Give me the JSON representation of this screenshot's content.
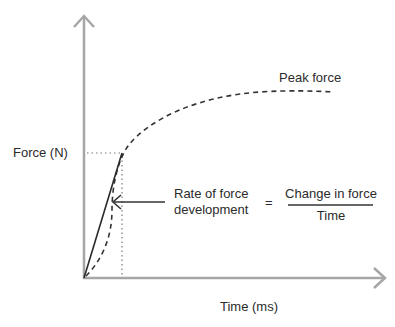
{
  "diagram": {
    "title": "Rate of force development",
    "y_axis_label": "Force (N)",
    "x_axis_label": "Time (ms)",
    "curve_label": "Peak force",
    "pointer_label_line1": "Rate of force",
    "pointer_label_line2": "development",
    "equals": "=",
    "fraction_numerator": "Change in force",
    "fraction_denominator": "Time",
    "colors": {
      "axis": "#a6a6a6",
      "curve": "#333333",
      "text": "#2b2b2b",
      "guide": "#777777"
    }
  }
}
